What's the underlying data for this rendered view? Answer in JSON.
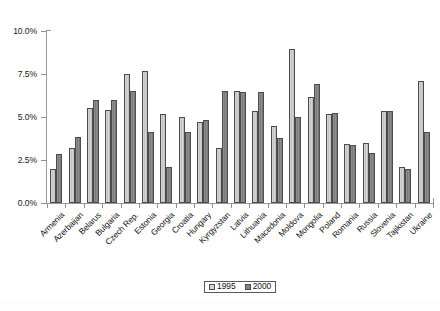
{
  "chart_data": {
    "type": "bar",
    "title": "",
    "xlabel": "",
    "ylabel": "",
    "ylim": [
      0.0,
      10.0
    ],
    "yticks": [
      "0.0%",
      "2.5%",
      "5.0%",
      "7.5%",
      "10.0%"
    ],
    "ytick_values": [
      0.0,
      2.5,
      5.0,
      7.5,
      10.0
    ],
    "grid": false,
    "legend_position": "bottom-center",
    "categories": [
      "Armenia",
      "Azerbaijan",
      "Belarus",
      "Bulgaria",
      "Czech Rep.",
      "Estonia",
      "Georgia",
      "Croatia",
      "Hungary",
      "Kyrgyzstan",
      "Latvia",
      "Lithuania",
      "Macedonia",
      "Moldova",
      "Mongolia",
      "Poland",
      "Romania",
      "Russia",
      "Slovenia",
      "Tajikistan",
      "Ukraine"
    ],
    "series": [
      {
        "name": "1995",
        "color": "#cccccc",
        "values": [
          2.0,
          3.2,
          5.5,
          5.4,
          7.5,
          7.7,
          5.15,
          5.0,
          4.7,
          3.2,
          6.5,
          5.35,
          4.5,
          8.95,
          6.15,
          5.2,
          3.45,
          3.5,
          5.35,
          2.1,
          7.1
        ]
      },
      {
        "name": "2000",
        "color": "#868686",
        "values": [
          2.85,
          3.85,
          6.0,
          6.0,
          6.5,
          4.1,
          2.1,
          4.15,
          4.85,
          6.5,
          6.45,
          6.45,
          3.8,
          5.0,
          6.9,
          5.25,
          3.4,
          2.9,
          5.35,
          2.0,
          4.1
        ]
      }
    ]
  },
  "legend": {
    "items": [
      {
        "label": "1995",
        "swatch": "light-gray-swatch"
      },
      {
        "label": "2000",
        "swatch": "dark-gray-swatch"
      }
    ]
  }
}
